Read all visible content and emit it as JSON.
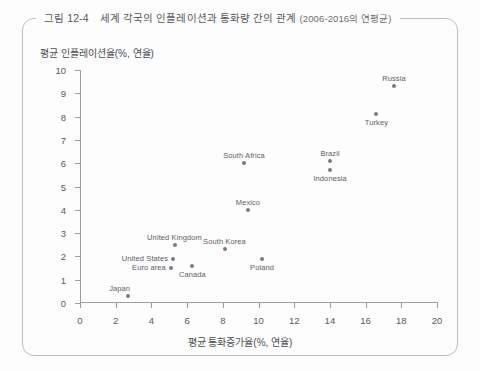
{
  "figure": {
    "caption_number": "그림 12-4",
    "caption_text": "세계 각국의 인플레이션과 통화량 간의 관계",
    "caption_period": "(2006-2016의 연평균)"
  },
  "chart_data": {
    "type": "scatter",
    "title": "세계 각국의 인플레이션과 통화량 간의 관계 (2006-2016의 연평균)",
    "xlabel": "평균 통화증가율(%, 연율)",
    "ylabel": "평균 인플레이션율(%, 연율)",
    "xlim": [
      0,
      20
    ],
    "ylim": [
      0,
      10
    ],
    "xticks": [
      "0",
      "2",
      "4",
      "6",
      "8",
      "10",
      "12",
      "14",
      "16",
      "18",
      "20"
    ],
    "yticks": [
      "0",
      "1",
      "2",
      "3",
      "4",
      "5",
      "6",
      "7",
      "8",
      "9",
      "10"
    ],
    "grid": false,
    "legend": "none",
    "point_color": "#76797d",
    "points": [
      {
        "label": "Japan",
        "x": 2.7,
        "y": 0.3,
        "label_pos": "left-above"
      },
      {
        "label": "Euro area",
        "x": 5.1,
        "y": 1.5,
        "label_pos": "left"
      },
      {
        "label": "United States",
        "x": 5.2,
        "y": 1.9,
        "label_pos": "left"
      },
      {
        "label": "United Kingdom",
        "x": 5.3,
        "y": 2.5,
        "label_pos": "above"
      },
      {
        "label": "Canada",
        "x": 6.3,
        "y": 1.6,
        "label_pos": "below"
      },
      {
        "label": "South Korea",
        "x": 8.1,
        "y": 2.3,
        "label_pos": "above"
      },
      {
        "label": "South Africa",
        "x": 9.2,
        "y": 6.0,
        "label_pos": "above"
      },
      {
        "label": "Poland",
        "x": 10.2,
        "y": 1.9,
        "label_pos": "below"
      },
      {
        "label": "Mexico",
        "x": 9.4,
        "y": 4.0,
        "label_pos": "above"
      },
      {
        "label": "Brazil",
        "x": 14.0,
        "y": 6.1,
        "label_pos": "above"
      },
      {
        "label": "Indonesia",
        "x": 14.0,
        "y": 5.7,
        "label_pos": "below"
      },
      {
        "label": "Turkey",
        "x": 16.6,
        "y": 8.1,
        "label_pos": "below"
      },
      {
        "label": "Russia",
        "x": 17.6,
        "y": 9.3,
        "label_pos": "above"
      }
    ]
  }
}
